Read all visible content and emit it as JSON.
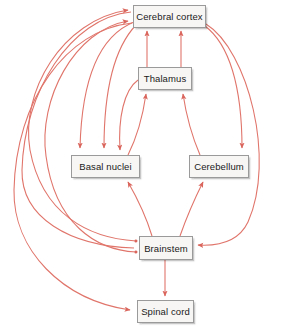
{
  "diagram": {
    "type": "flow-diagram",
    "background_color": "#ffffff",
    "edge_color": "#e0756b",
    "node_fill_color": "#f7f6f4",
    "node_border_color": "#9a9a9a",
    "node_text_color": "#1a1a1a",
    "nodes": [
      {
        "id": "cerebral_cortex",
        "label": "Cerebral cortex",
        "x": 133,
        "y": 5,
        "w": 73,
        "h": 23
      },
      {
        "id": "thalamus",
        "label": "Thalamus",
        "x": 138,
        "y": 67,
        "w": 54,
        "h": 23
      },
      {
        "id": "basal_nuclei",
        "label": "Basal nuclei",
        "x": 71,
        "y": 155,
        "w": 69,
        "h": 23
      },
      {
        "id": "cerebellum",
        "label": "Cerebellum",
        "x": 189,
        "y": 155,
        "w": 60,
        "h": 23
      },
      {
        "id": "brainstem",
        "label": "Brainstem",
        "x": 139,
        "y": 236,
        "w": 54,
        "h": 24
      },
      {
        "id": "spinal_cord",
        "label": "Spinal cord",
        "x": 137,
        "y": 300,
        "w": 57,
        "h": 23
      }
    ],
    "edges": [
      {
        "id": "e1",
        "from": "thalamus",
        "to": "cerebral_cortex",
        "label": ""
      },
      {
        "id": "e2",
        "from": "thalamus",
        "to": "cerebral_cortex",
        "label": ""
      },
      {
        "id": "e3",
        "from": "basal_nuclei",
        "to": "thalamus",
        "label": ""
      },
      {
        "id": "e4",
        "from": "cerebellum",
        "to": "thalamus",
        "label": ""
      },
      {
        "id": "e5",
        "from": "cerebral_cortex",
        "to": "basal_nuclei",
        "label": ""
      },
      {
        "id": "e6",
        "from": "cerebral_cortex",
        "to": "basal_nuclei",
        "label": ""
      },
      {
        "id": "e7",
        "from": "thalamus",
        "to": "basal_nuclei",
        "label": ""
      },
      {
        "id": "e8",
        "from": "cerebral_cortex",
        "to": "cerebellum",
        "label": ""
      },
      {
        "id": "e9",
        "from": "brainstem",
        "to": "basal_nuclei",
        "label": ""
      },
      {
        "id": "e10",
        "from": "brainstem",
        "to": "cerebellum",
        "label": ""
      },
      {
        "id": "e11",
        "from": "cerebral_cortex",
        "to": "brainstem",
        "label": ""
      },
      {
        "id": "e12",
        "from": "brainstem",
        "to": "cerebral_cortex",
        "label": ""
      },
      {
        "id": "e13",
        "from": "brainstem",
        "to": "cerebral_cortex",
        "label": ""
      },
      {
        "id": "e14",
        "from": "brainstem",
        "to": "spinal_cord",
        "label": ""
      },
      {
        "id": "e15",
        "from": "spinal_cord",
        "to": "cerebral_cortex",
        "label": ""
      },
      {
        "id": "e16",
        "from": "cerebral_cortex",
        "to": "spinal_cord",
        "label": ""
      },
      {
        "id": "e17",
        "from": "cerebral_cortex",
        "to": "brainstem",
        "label": ""
      }
    ]
  }
}
